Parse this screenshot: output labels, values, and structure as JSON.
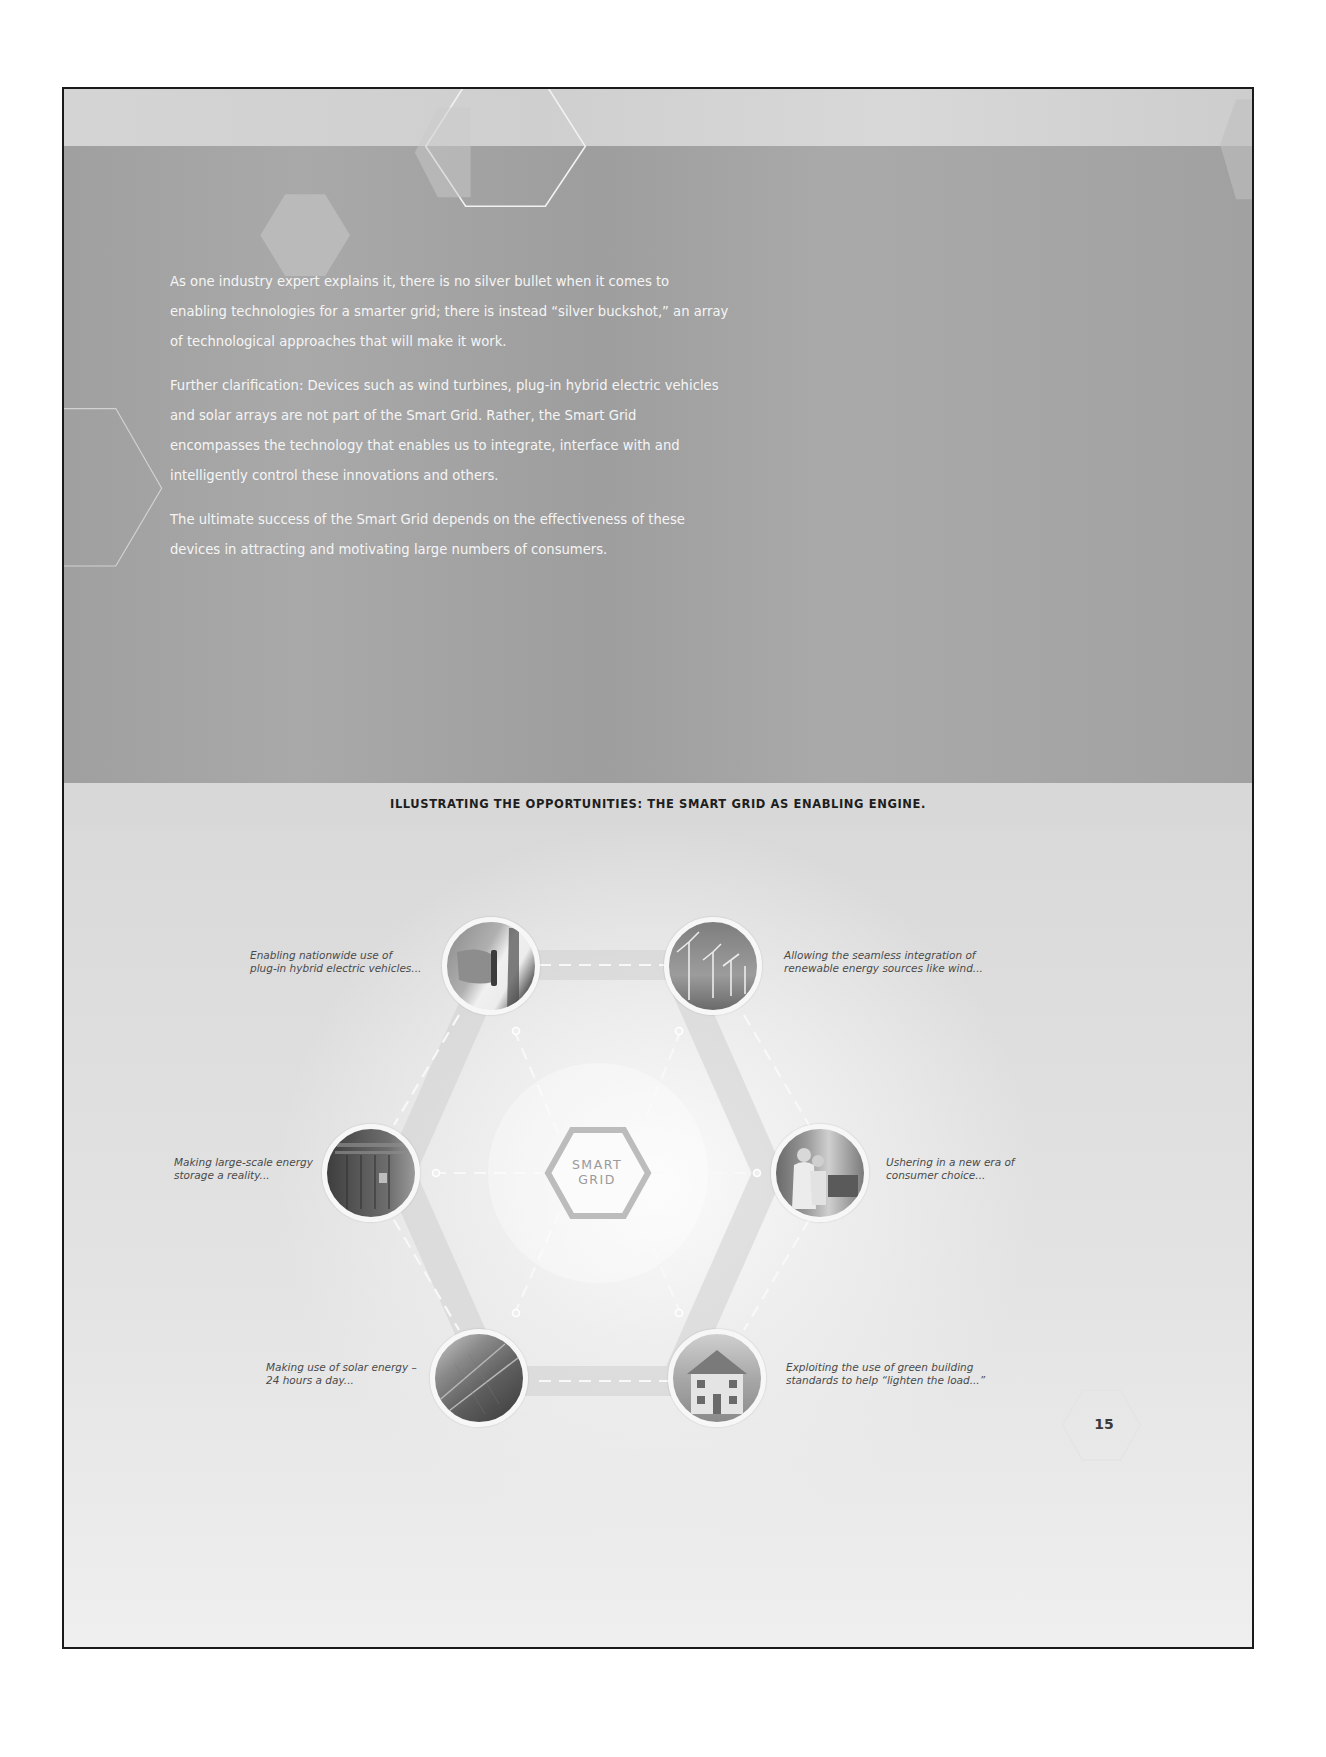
{
  "page": {
    "number": "15"
  },
  "intro": {
    "paragraphs": [
      "As one industry expert explains it, there is no silver bullet when it comes to enabling technologies for a smarter grid; there is instead “silver buckshot,” an array of technological approaches that will make it work.",
      "Further clarification: Devices such as wind turbines, plug-in hybrid electric vehicles and solar arrays are not part of the Smart Grid. Rather, the Smart Grid encompasses the technology that enables us to integrate, interface with and intelligently control these innovations and others.",
      "The ultimate success of the Smart Grid depends on the effectiveness of these devices in attracting and motivating large numbers of consumers."
    ]
  },
  "section": {
    "title": "ILLUSTRATING THE OPPORTUNITIES: THE SMART GRID AS ENABLING ENGINE."
  },
  "diagram": {
    "center_label_line1": "SMART",
    "center_label_line2": "GRID",
    "nodes": [
      {
        "id": "phev",
        "image_icon": "ev-plug-icon",
        "caption": "Enabling nationwide use of\nplug-in hybrid electric vehicles..."
      },
      {
        "id": "wind",
        "image_icon": "wind-turbine-icon",
        "caption": "Allowing the seamless integration of\nrenewable energy sources like wind..."
      },
      {
        "id": "storage",
        "image_icon": "energy-storage-icon",
        "caption": "Making large-scale energy\nstorage a reality..."
      },
      {
        "id": "consumer",
        "image_icon": "consumer-icon",
        "caption": "Ushering in a new era of\nconsumer choice..."
      },
      {
        "id": "solar",
        "image_icon": "solar-panel-icon",
        "caption": "Making use of solar energy –\n24 hours a day..."
      },
      {
        "id": "green-building",
        "image_icon": "house-icon",
        "caption": "Exploiting the use of green building\nstandards to help “lighten the load...”"
      }
    ]
  },
  "colors": {
    "dark_band": "#a6a6a6",
    "title_band": "#d8d8d8",
    "body_text": "#f5f5f5",
    "caption_text": "#4a4a4a",
    "border": "#1a1a1a"
  }
}
